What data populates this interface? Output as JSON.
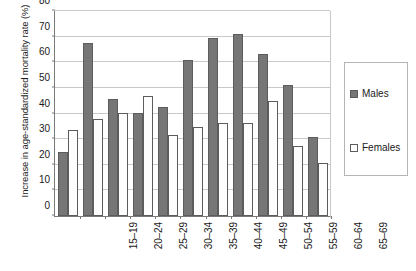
{
  "chart_data": {
    "type": "bar",
    "title": "",
    "xlabel": "",
    "ylabel": "Increase in age-standardized mortality rate (%)",
    "ylim": [
      0,
      80
    ],
    "yticks": [
      0,
      10,
      20,
      30,
      40,
      50,
      60,
      70,
      80
    ],
    "ytick_labels": [
      "0",
      "10",
      "20",
      "30",
      "40",
      "50",
      "60",
      "70",
      "80"
    ],
    "grid": true,
    "legend_position": "right",
    "categories": [
      "15–19",
      "20–24",
      "25–29",
      "30–34",
      "35–39",
      "40–44",
      "45–49",
      "50–54",
      "55–59",
      "60–64",
      "65–69"
    ],
    "series": [
      {
        "name": "Males",
        "color": "#767676",
        "values": [
          25,
          67,
          45.5,
          40,
          42.5,
          60.5,
          69,
          70.5,
          63,
          51,
          30.5
        ]
      },
      {
        "name": "Females",
        "color": "#ffffff",
        "values": [
          33.5,
          37.5,
          40,
          46.5,
          31.5,
          34.5,
          36,
          36,
          44.5,
          27,
          20.5
        ]
      }
    ]
  },
  "legend": {
    "entries": [
      {
        "label": "Males"
      },
      {
        "label": "Females"
      }
    ]
  },
  "colors": {
    "males_fill": "#767676",
    "females_fill": "#ffffff",
    "bar_border": "#5c5c5c",
    "gridline": "#c9c9c9",
    "axis": "#7a7a7a",
    "text": "#1a1a1a"
  }
}
